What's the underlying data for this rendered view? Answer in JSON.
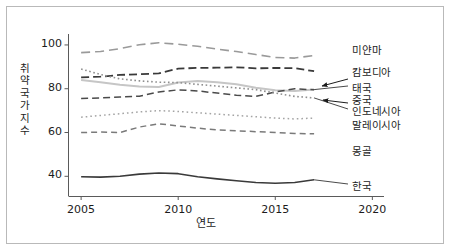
{
  "chart_data": {
    "type": "line",
    "title": "",
    "xlabel": "연도",
    "ylabel": "취약국가지수",
    "xlim": [
      2004.35,
      2020.6
    ],
    "ylim": [
      31,
      105
    ],
    "xticks": [
      2005,
      2010,
      2015,
      2020
    ],
    "xtick_labels": [
      "2005",
      "2010",
      "2015",
      "2020"
    ],
    "yticks": [
      40,
      60,
      80,
      100
    ],
    "ytick_labels": [
      "40",
      "60",
      "80",
      "100"
    ],
    "grid": false,
    "legend_position": "right-inline-labels",
    "x": [
      2005,
      2006,
      2007,
      2008,
      2009,
      2010,
      2011,
      2012,
      2013,
      2014,
      2015,
      2016,
      2017
    ],
    "series": [
      {
        "name": "미얀마",
        "label": "미얀마",
        "color": "#9a9a9a",
        "dash": "9,5",
        "width": 1.6,
        "values": [
          96.5,
          97.0,
          98.3,
          100.1,
          101.0,
          100.3,
          99.4,
          98.1,
          97.0,
          95.6,
          94.3,
          94.0,
          95.2
        ],
        "label_x": 352,
        "label_y": 42
      },
      {
        "name": "캄보디아",
        "label": "캄보디아",
        "color": "#3a3a3a",
        "dash": "8,4",
        "width": 1.8,
        "values": [
          85.2,
          85.5,
          86.3,
          86.6,
          87.0,
          89.2,
          89.5,
          89.6,
          89.8,
          89.3,
          89.5,
          89.4,
          88.0
        ],
        "label_x": 352,
        "label_y": 64
      },
      {
        "name": "태국",
        "label": "태국",
        "color": "#c6c6c6",
        "dash": "none",
        "width": 2.0,
        "values": [
          84.0,
          83.0,
          81.8,
          81.0,
          80.8,
          82.8,
          83.5,
          83.0,
          82.0,
          80.5,
          79.3,
          79.0,
          79.6
        ],
        "label_x": 352,
        "label_y": 80
      },
      {
        "name": "중국",
        "label": "중국",
        "color": "#4a4a4a",
        "dash": "7,4",
        "width": 1.5,
        "values": [
          75.5,
          75.8,
          76.2,
          76.6,
          78.5,
          79.5,
          79.0,
          78.0,
          77.0,
          76.5,
          78.5,
          80.0,
          79.5
        ],
        "label_x": 352,
        "label_y": 92
      },
      {
        "name": "인도네시아",
        "label": "인도네시아",
        "color": "#8f8f8f",
        "dash": "1.6,2.6",
        "width": 1.6,
        "values": [
          89.0,
          86.5,
          84.5,
          83.6,
          83.0,
          82.8,
          82.0,
          81.2,
          80.4,
          79.6,
          78.0,
          76.5,
          75.8
        ],
        "label_x": 352,
        "label_y": 103
      },
      {
        "name": "말레이시아",
        "label": "말레이시아",
        "color": "#a4a4a4",
        "dash": "1.6,3.0",
        "width": 1.5,
        "values": [
          67.0,
          67.8,
          68.6,
          69.4,
          70.0,
          69.6,
          69.0,
          68.4,
          67.8,
          67.2,
          66.6,
          66.2,
          66.6
        ],
        "label_x": 352,
        "label_y": 117
      },
      {
        "name": "몽골",
        "label": "몽골",
        "color": "#7a7a7a",
        "dash": "6,4",
        "width": 1.5,
        "values": [
          60.0,
          60.2,
          60.0,
          62.5,
          64.0,
          63.0,
          62.0,
          61.2,
          60.8,
          60.4,
          60.0,
          59.6,
          59.4
        ],
        "label_x": 352,
        "label_y": 143
      },
      {
        "name": "한국",
        "label": "한국",
        "color": "#3a3a3a",
        "dash": "none",
        "width": 1.6,
        "values": [
          39.8,
          39.6,
          40.0,
          41.0,
          41.5,
          41.2,
          39.8,
          38.8,
          38.0,
          37.2,
          36.8,
          37.2,
          38.4
        ],
        "label_x": 352,
        "label_y": 178
      }
    ],
    "annotations": [
      {
        "name": "arrow-thailand",
        "text": "",
        "from_x": 348,
        "from_y": 79,
        "to_x": 322,
        "to_y": 86
      },
      {
        "name": "arrow-indonesia",
        "text": "",
        "from_x": 348,
        "from_y": 103,
        "to_x": 323,
        "to_y": 100
      }
    ]
  },
  "axes": {
    "ylabel_chars": [
      "취",
      "약",
      "국",
      "가",
      "지",
      "수"
    ],
    "xlabel": "연도"
  }
}
